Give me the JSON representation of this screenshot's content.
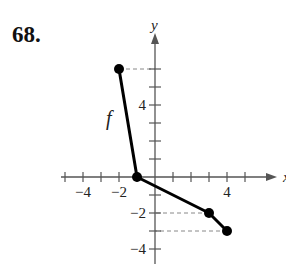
{
  "problem": {
    "number": "68."
  },
  "chart_data": {
    "type": "line",
    "title": "",
    "function_label": "f",
    "xlabel": "x",
    "ylabel": "y",
    "xlim": [
      -5,
      6
    ],
    "ylim": [
      -5,
      8
    ],
    "x_ticks": [
      -5,
      -4,
      -3,
      -2,
      -1,
      1,
      2,
      3,
      4,
      5
    ],
    "y_ticks": [
      -4,
      -3,
      -2,
      -1,
      1,
      2,
      3,
      4,
      5,
      6
    ],
    "x_tick_labels": [
      {
        "value": -4,
        "label": "−4"
      },
      {
        "value": -2,
        "label": "−2"
      },
      {
        "value": 4,
        "label": "4"
      }
    ],
    "y_tick_labels": [
      {
        "value": 4,
        "label": "4"
      },
      {
        "value": -2,
        "label": "−2"
      },
      {
        "value": -4,
        "label": "−4"
      }
    ],
    "series": [
      {
        "name": "f",
        "points": [
          [
            -2,
            6
          ],
          [
            -1,
            0
          ],
          [
            3,
            -2
          ],
          [
            4,
            -3
          ]
        ]
      }
    ],
    "endpoints_closed": [
      [
        -2,
        6
      ],
      [
        4,
        -3
      ]
    ],
    "vertex_marked": [
      [
        -1,
        0
      ],
      [
        3,
        -2
      ]
    ],
    "dashed_guides": [
      {
        "from": [
          -2,
          6
        ],
        "to": [
          0,
          6
        ]
      },
      {
        "from": [
          3,
          -2
        ],
        "to": [
          0,
          -2
        ]
      },
      {
        "from": [
          4,
          -3
        ],
        "to": [
          0,
          -3
        ]
      }
    ],
    "grid": false
  }
}
